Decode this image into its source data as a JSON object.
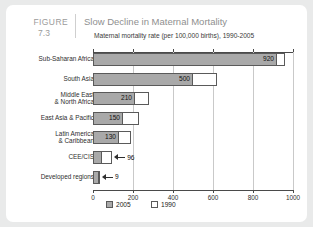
{
  "figure": {
    "label": "FIGURE",
    "number": "7.3"
  },
  "chart_data": {
    "type": "bar",
    "orientation": "horizontal",
    "title": "Slow Decline in Maternal Mortality",
    "subtitle": "Maternal mortality rate (per 100,000 births), 1990-2005",
    "xlabel": "",
    "ylabel": "",
    "xlim": [
      0,
      1000
    ],
    "xticks": [
      0,
      200,
      400,
      600,
      800,
      1000
    ],
    "xtick_labels": [
      "0",
      "200",
      "400",
      "600",
      "800",
      "1000"
    ],
    "grid": true,
    "legend_position": "bottom-left",
    "categories": [
      "Sub-Saharan Africa",
      "South Asia",
      "Middle East\n& North Africa",
      "East Asia & Pacific",
      "Latin America\n& Caribbean",
      "CEE/CIS",
      "Developed regions"
    ],
    "series": [
      {
        "name": "2005",
        "color": "#a9a9a9",
        "values": [
          920,
          500,
          210,
          150,
          130,
          46,
          9
        ],
        "labels": [
          "920",
          "500",
          "210",
          "150",
          "130",
          "96",
          "9"
        ]
      },
      {
        "name": "1990",
        "color": "#ffffff",
        "values": [
          960,
          620,
          280,
          230,
          190,
          96,
          20
        ],
        "labels": [
          "",
          "",
          "",
          "",
          "",
          "",
          ""
        ]
      }
    ]
  },
  "legend": {
    "entries": [
      {
        "label": "2005",
        "swatch": "sw-2005"
      },
      {
        "label": "1990",
        "swatch": "sw-1990"
      }
    ]
  }
}
